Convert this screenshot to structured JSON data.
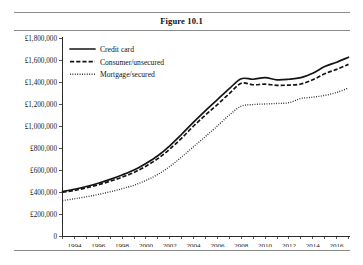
{
  "figure": {
    "title": "Figure 10.1",
    "currency_symbol": "£"
  },
  "chart_data": {
    "type": "line",
    "title": "Figure 10.1",
    "xlabel": "",
    "ylabel": "",
    "grid": false,
    "legend_position": "top-left-inside",
    "xlim": [
      1993,
      2017
    ],
    "ylim": [
      0,
      1800000
    ],
    "y_ticks": [
      0,
      200000,
      400000,
      600000,
      800000,
      1000000,
      1200000,
      1400000,
      1600000,
      1800000
    ],
    "y_tick_labels": [
      "0",
      "£200,000",
      "£400,000",
      "£600,000",
      "£800,000",
      "£1,000,000",
      "£1,200,000",
      "£1,400,000",
      "£1,600,000",
      "£1,800,000"
    ],
    "x_ticks_major": [
      1994,
      1996,
      1998,
      2000,
      2002,
      2004,
      2006,
      2008,
      2010,
      2012,
      2014,
      2016
    ],
    "x_tick_labels": [
      "1994",
      "1996",
      "1998",
      "2000",
      "2002",
      "2004",
      "2006",
      "2008",
      "2010",
      "2012",
      "2014",
      "2016"
    ],
    "x_ticks_minor": [
      1993,
      1995,
      1997,
      1999,
      2001,
      2003,
      2005,
      2007,
      2009,
      2011,
      2013,
      2015,
      2017
    ],
    "x": [
      1993,
      1994,
      1995,
      1996,
      1997,
      1998,
      1999,
      2000,
      2001,
      2002,
      2003,
      2004,
      2005,
      2006,
      2007,
      2008,
      2009,
      2010,
      2011,
      2012,
      2013,
      2014,
      2015,
      2016,
      2017
    ],
    "series": [
      {
        "name": "Credit card",
        "style": "solid",
        "values": [
          405000,
          425000,
          450000,
          480000,
          515000,
          555000,
          600000,
          660000,
          730000,
          820000,
          925000,
          1035000,
          1140000,
          1240000,
          1340000,
          1430000,
          1425000,
          1440000,
          1420000,
          1425000,
          1440000,
          1480000,
          1540000,
          1580000,
          1625000
        ]
      },
      {
        "name": "Consumer/unsecured",
        "style": "dashed",
        "values": [
          398000,
          415000,
          438000,
          466000,
          498000,
          535000,
          578000,
          635000,
          703000,
          790000,
          890000,
          1000000,
          1100000,
          1195000,
          1295000,
          1388000,
          1375000,
          1380000,
          1370000,
          1372000,
          1382000,
          1420000,
          1475000,
          1515000,
          1560000
        ]
      },
      {
        "name": "Mortgage/secured",
        "style": "dotted",
        "values": [
          322000,
          338000,
          356000,
          378000,
          402000,
          430000,
          462000,
          505000,
          560000,
          632000,
          718000,
          812000,
          905000,
          1000000,
          1100000,
          1180000,
          1195000,
          1200000,
          1205000,
          1212000,
          1250000,
          1262000,
          1278000,
          1305000,
          1345000
        ]
      }
    ]
  },
  "legend": {
    "entries": [
      {
        "label": "Credit card",
        "style": "solid"
      },
      {
        "label": "Consumer/unsecured",
        "style": "dashed"
      },
      {
        "label": "Mortgage/secured",
        "style": "dotted"
      }
    ]
  }
}
